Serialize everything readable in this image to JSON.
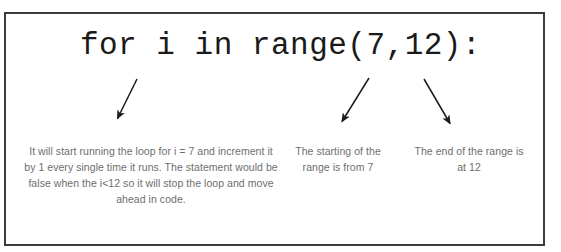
{
  "slide": {
    "background_color": "#ffffff",
    "frame": {
      "border_color": "#3b3b3b",
      "border_width_px": 2
    },
    "code": {
      "text": "for i in range(7,12):",
      "color": "#1a1a1a"
    },
    "annotations": [
      {
        "id": "loop-body-explanation",
        "text": "It will start running the loop for i = 7 and increment it by 1 every single time it runs.  The statement would be false when the i<12 so it will stop the loop and move ahead in code.",
        "color": "#6e6e6e",
        "arrow": {
          "name": "arrow-to-for-keyword",
          "direction": "down-left",
          "from": [
            137,
            79
          ],
          "to": [
            116,
            120
          ]
        }
      },
      {
        "id": "range-start-explanation",
        "text": "The starting of the range is from 7",
        "color": "#6e6e6e",
        "arrow": {
          "name": "arrow-to-range-start",
          "direction": "down-left",
          "from": [
            369,
            78
          ],
          "to": [
            340,
            124
          ]
        }
      },
      {
        "id": "range-end-explanation",
        "text": "The end of the range is at 12",
        "color": "#6e6e6e",
        "arrow": {
          "name": "arrow-to-range-end",
          "direction": "down-right",
          "from": [
            424,
            79
          ],
          "to": [
            452,
            126
          ]
        }
      }
    ]
  }
}
